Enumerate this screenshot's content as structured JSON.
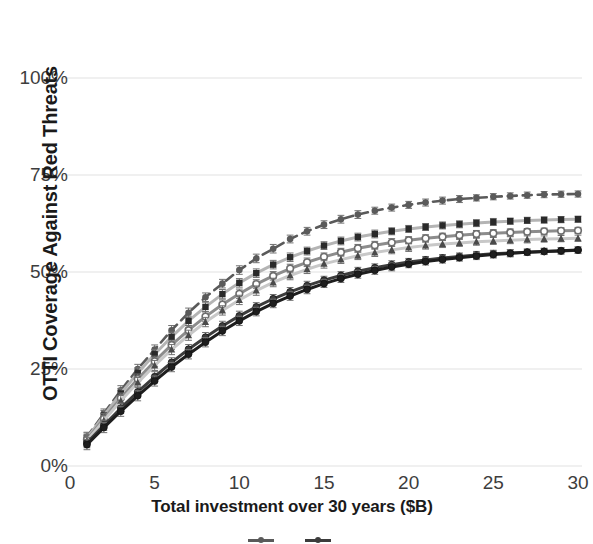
{
  "chart_data": {
    "type": "line",
    "title": "",
    "xlabel": "Total investment over 30 years ($B)",
    "ylabel": "OTTI Coverage Against Red Threats",
    "xlim": [
      0,
      30
    ],
    "ylim": [
      0,
      1.0
    ],
    "grid": true,
    "legend_position": "bottom",
    "xticks": [
      0,
      5,
      10,
      15,
      20,
      25,
      30
    ],
    "xtick_labels": [
      "0",
      "5",
      "10",
      "15",
      "20",
      "25",
      "30"
    ],
    "yticks": [
      0,
      0.25,
      0.5,
      0.75,
      1.0
    ],
    "ytick_labels": [
      "0%",
      "25%",
      "50%",
      "75%",
      "100%"
    ],
    "x": [
      1,
      2,
      3,
      4,
      5,
      6,
      7,
      8,
      9,
      10,
      11,
      12,
      13,
      14,
      15,
      16,
      17,
      18,
      19,
      20,
      21,
      22,
      23,
      24,
      25,
      26,
      27,
      28,
      29,
      30
    ],
    "series": [
      {
        "name": "Series 1",
        "color": "#5a5a5a",
        "line_style": "dashed",
        "marker": "circle",
        "values": [
          0.075,
          0.135,
          0.195,
          0.25,
          0.3,
          0.35,
          0.395,
          0.435,
          0.47,
          0.505,
          0.535,
          0.56,
          0.585,
          0.605,
          0.622,
          0.636,
          0.648,
          0.658,
          0.666,
          0.673,
          0.679,
          0.684,
          0.688,
          0.691,
          0.694,
          0.696,
          0.698,
          0.6995,
          0.7005,
          0.701
        ],
        "error": [
          0.012,
          0.012,
          0.012,
          0.012,
          0.012,
          0.012,
          0.012,
          0.011,
          0.011,
          0.011,
          0.011,
          0.011,
          0.01,
          0.01,
          0.01,
          0.01,
          0.01,
          0.009,
          0.009,
          0.009,
          0.009,
          0.009,
          0.009,
          0.008,
          0.008,
          0.008,
          0.008,
          0.008,
          0.008,
          0.008
        ]
      },
      {
        "name": "Series 2",
        "color": "#b4b4b4",
        "line_style": "solid",
        "marker": "square",
        "values": [
          0.072,
          0.13,
          0.187,
          0.24,
          0.288,
          0.333,
          0.374,
          0.41,
          0.443,
          0.472,
          0.497,
          0.519,
          0.538,
          0.554,
          0.568,
          0.58,
          0.59,
          0.598,
          0.605,
          0.611,
          0.616,
          0.62,
          0.623,
          0.626,
          0.629,
          0.631,
          0.633,
          0.634,
          0.635,
          0.636
        ],
        "error": [
          0.013,
          0.013,
          0.013,
          0.013,
          0.012,
          0.012,
          0.012,
          0.012,
          0.012,
          0.011,
          0.011,
          0.011,
          0.011,
          0.01,
          0.01,
          0.01,
          0.01,
          0.01,
          0.009,
          0.009,
          0.009,
          0.009,
          0.009,
          0.009,
          0.009,
          0.008,
          0.008,
          0.008,
          0.008,
          0.008
        ]
      },
      {
        "name": "Series 3",
        "color": "#8c8c8c",
        "line_style": "solid",
        "marker": "open-circle",
        "values": [
          0.068,
          0.122,
          0.175,
          0.224,
          0.27,
          0.312,
          0.35,
          0.385,
          0.416,
          0.444,
          0.469,
          0.49,
          0.509,
          0.525,
          0.539,
          0.551,
          0.561,
          0.569,
          0.576,
          0.582,
          0.587,
          0.591,
          0.595,
          0.598,
          0.6,
          0.602,
          0.604,
          0.605,
          0.606,
          0.607
        ],
        "error": [
          0.013,
          0.013,
          0.013,
          0.013,
          0.013,
          0.012,
          0.012,
          0.012,
          0.012,
          0.012,
          0.011,
          0.011,
          0.011,
          0.011,
          0.01,
          0.01,
          0.01,
          0.01,
          0.01,
          0.009,
          0.009,
          0.009,
          0.009,
          0.009,
          0.009,
          0.009,
          0.008,
          0.008,
          0.008,
          0.008
        ]
      },
      {
        "name": "Series 4",
        "color": "#c8c8c8",
        "line_style": "solid",
        "marker": "triangle",
        "values": [
          0.065,
          0.117,
          0.168,
          0.215,
          0.259,
          0.3,
          0.337,
          0.371,
          0.401,
          0.428,
          0.452,
          0.473,
          0.491,
          0.507,
          0.521,
          0.532,
          0.542,
          0.55,
          0.557,
          0.563,
          0.568,
          0.572,
          0.575,
          0.578,
          0.58,
          0.582,
          0.584,
          0.585,
          0.586,
          0.587
        ],
        "error": [
          0.014,
          0.014,
          0.014,
          0.013,
          0.013,
          0.013,
          0.013,
          0.012,
          0.012,
          0.012,
          0.012,
          0.011,
          0.011,
          0.011,
          0.011,
          0.01,
          0.01,
          0.01,
          0.01,
          0.01,
          0.009,
          0.009,
          0.009,
          0.009,
          0.009,
          0.009,
          0.009,
          0.008,
          0.008,
          0.008
        ]
      },
      {
        "name": "Series 5",
        "color": "#3c3c3c",
        "line_style": "solid",
        "marker": "filled-circle",
        "values": [
          0.06,
          0.105,
          0.149,
          0.191,
          0.23,
          0.267,
          0.301,
          0.332,
          0.361,
          0.387,
          0.41,
          0.431,
          0.449,
          0.465,
          0.479,
          0.491,
          0.502,
          0.511,
          0.519,
          0.526,
          0.531,
          0.536,
          0.54,
          0.544,
          0.547,
          0.549,
          0.551,
          0.553,
          0.554,
          0.556
        ],
        "error": [
          0.013,
          0.013,
          0.013,
          0.013,
          0.013,
          0.012,
          0.012,
          0.012,
          0.012,
          0.012,
          0.011,
          0.011,
          0.011,
          0.011,
          0.01,
          0.01,
          0.01,
          0.01,
          0.01,
          0.009,
          0.009,
          0.009,
          0.009,
          0.009,
          0.009,
          0.009,
          0.008,
          0.008,
          0.008,
          0.008
        ]
      },
      {
        "name": "Series 6",
        "color": "#1e1e1e",
        "line_style": "solid",
        "marker": "filled-circle",
        "values": [
          0.055,
          0.099,
          0.141,
          0.181,
          0.219,
          0.255,
          0.288,
          0.319,
          0.348,
          0.374,
          0.398,
          0.419,
          0.438,
          0.455,
          0.47,
          0.483,
          0.494,
          0.504,
          0.513,
          0.52,
          0.527,
          0.532,
          0.537,
          0.541,
          0.545,
          0.548,
          0.551,
          0.553,
          0.555,
          0.557
        ],
        "error": [
          0.013,
          0.013,
          0.013,
          0.013,
          0.013,
          0.012,
          0.012,
          0.012,
          0.012,
          0.012,
          0.011,
          0.011,
          0.011,
          0.011,
          0.01,
          0.01,
          0.01,
          0.01,
          0.01,
          0.009,
          0.009,
          0.009,
          0.009,
          0.009,
          0.009,
          0.009,
          0.008,
          0.008,
          0.008,
          0.008
        ]
      }
    ]
  },
  "legend": {
    "items": [
      {
        "label": "",
        "color": "#5a5a5a"
      },
      {
        "label": "",
        "color": "#3c3c3c"
      }
    ]
  },
  "axis": {
    "ylabel": "OTTI Coverage Against Red Threats",
    "xlabel": "Total investment over 30 years ($B)"
  }
}
